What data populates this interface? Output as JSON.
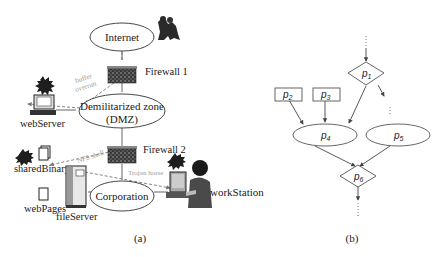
{
  "figure_a": {
    "caption": "(a)",
    "nodes": {
      "internet": "Internet",
      "dmz_line1": "Demilitarized zone",
      "dmz_line2": "(DMZ)",
      "corporation": "Corporation"
    },
    "firewalls": {
      "fw1": "Firewall 1",
      "fw2": "Firewall 2"
    },
    "hosts": {
      "webServer": "webServer",
      "sharedBinary": "sharedBinary",
      "webPages": "webPages",
      "fileServer": "fileServer",
      "workStation": "workStation"
    },
    "attacks": {
      "buffer_line1": "buffer",
      "buffer_line2": "overrun",
      "nfs": "NFS shell",
      "trojan": "Trojan horse"
    },
    "icons": [
      "attacker-icon",
      "firewall-icon",
      "computer-icon",
      "server-icon",
      "file-icon",
      "user-workstation-icon",
      "compromised-burst-icon"
    ]
  },
  "figure_b": {
    "caption": "(b)",
    "nodes": [
      {
        "id": "p1",
        "base": "p",
        "sub": "1",
        "shape": "diamond"
      },
      {
        "id": "p2",
        "base": "p",
        "sub": "2",
        "shape": "rectangle"
      },
      {
        "id": "p3",
        "base": "p",
        "sub": "3",
        "shape": "rectangle"
      },
      {
        "id": "p4",
        "base": "p",
        "sub": "4",
        "shape": "ellipse"
      },
      {
        "id": "p5",
        "base": "p",
        "sub": "5",
        "shape": "ellipse"
      },
      {
        "id": "p6",
        "base": "p",
        "sub": "6",
        "shape": "diamond"
      }
    ],
    "edges": [
      [
        "p1",
        "p4"
      ],
      [
        "p2",
        "p4"
      ],
      [
        "p3",
        "p4"
      ],
      [
        "p4",
        "p6"
      ],
      [
        "p5",
        "p6"
      ]
    ]
  }
}
